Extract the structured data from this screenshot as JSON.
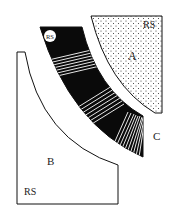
{
  "diagram": {
    "colors": {
      "background": "#ffffff",
      "ink": "#111111",
      "band": "#0a0a0a",
      "stripe": "#ffffff",
      "dots": "#333333"
    },
    "regions": [
      {
        "id": "A",
        "label": "A",
        "sublabel": "RS",
        "fill": "dotted"
      },
      {
        "id": "B",
        "label": "B",
        "sublabel": "RS",
        "fill": "blank"
      },
      {
        "id": "C",
        "label": "C",
        "fill": "none"
      },
      {
        "id": "band",
        "label": "",
        "sublabel": "RS",
        "fill": "black-with-striped-segments",
        "striped_segments": 3
      }
    ],
    "labels": {
      "a": "A",
      "a_rs": "RS",
      "b": "B",
      "b_rs": "RS",
      "c": "C",
      "band_rs": "RS"
    }
  }
}
